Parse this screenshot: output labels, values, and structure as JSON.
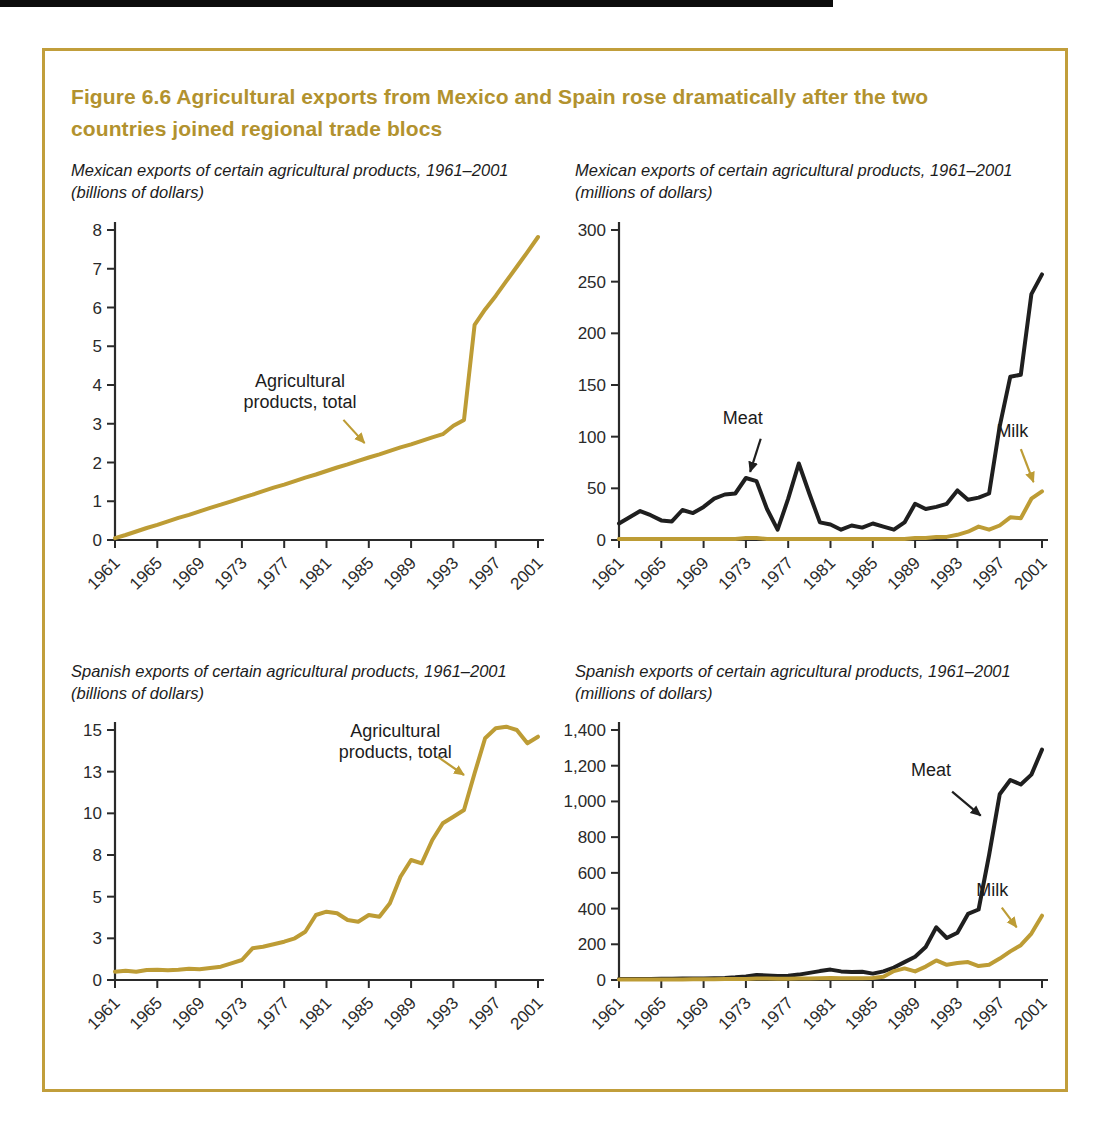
{
  "figure": {
    "title": "Figure 6.6  Agricultural exports from Mexico and Spain rose dramatically after the two countries joined regional trade blocs",
    "colors": {
      "gold": "#BD9C35",
      "black": "#1F1F1F",
      "border_gold": "#C19E3B",
      "title_gold": "#B2922E",
      "axis": "#2A2A2A",
      "label_text": "#2A2A2A"
    }
  },
  "chart_data": [
    {
      "id": "mexico-total",
      "type": "line",
      "subtitle_line1": "Mexican exports of certain agricultural products, 1961–2001",
      "subtitle_line2": "(billions of dollars)",
      "x_start": 1961,
      "x_end": 2001,
      "xticks": [
        1961,
        1965,
        1969,
        1973,
        1977,
        1981,
        1985,
        1989,
        1993,
        1997,
        2001
      ],
      "yticks": [
        {
          "v": 0,
          "label": "0"
        },
        {
          "v": 1,
          "label": "1"
        },
        {
          "v": 2,
          "label": "2"
        },
        {
          "v": 3,
          "label": "3"
        },
        {
          "v": 4,
          "label": "4"
        },
        {
          "v": 5,
          "label": "5"
        },
        {
          "v": 6,
          "label": "6"
        },
        {
          "v": 7,
          "label": "7"
        },
        {
          "v": 8,
          "label": "8"
        }
      ],
      "ylim": [
        0,
        8
      ],
      "series": [
        {
          "name": "Agricultural products, total",
          "color_key": "gold",
          "values": [
            0.05,
            0.13,
            0.22,
            0.31,
            0.39,
            0.48,
            0.57,
            0.65,
            0.74,
            0.83,
            0.91,
            1.0,
            1.09,
            1.17,
            1.26,
            1.35,
            1.43,
            1.52,
            1.61,
            1.69,
            1.78,
            1.87,
            1.95,
            2.04,
            2.13,
            2.21,
            2.3,
            2.39,
            2.47,
            2.56,
            2.65,
            2.73,
            2.95,
            3.1,
            5.55,
            5.95,
            6.3,
            6.68,
            7.05,
            7.43,
            7.82
          ]
        }
      ],
      "annotations": [
        {
          "lines": [
            "Agricultural",
            "products, total"
          ],
          "color_key": "gold",
          "text": {
            "x": 1978.5,
            "y": 3.95
          },
          "arrow": {
            "x1": 1982.6,
            "y1": 3.1,
            "x2": 1984.6,
            "y2": 2.5
          }
        }
      ]
    },
    {
      "id": "mexico-products",
      "type": "line",
      "subtitle_line1": "Mexican exports of certain agricultural products, 1961–2001",
      "subtitle_line2": "(millions of dollars)",
      "x_start": 1961,
      "x_end": 2001,
      "xticks": [
        1961,
        1965,
        1969,
        1973,
        1977,
        1981,
        1985,
        1989,
        1993,
        1997,
        2001
      ],
      "yticks": [
        {
          "v": 0,
          "label": "0"
        },
        {
          "v": 50,
          "label": "50"
        },
        {
          "v": 100,
          "label": "100"
        },
        {
          "v": 150,
          "label": "150"
        },
        {
          "v": 200,
          "label": "200"
        },
        {
          "v": 250,
          "label": "250"
        },
        {
          "v": 300,
          "label": "300"
        }
      ],
      "ylim": [
        0,
        300
      ],
      "series": [
        {
          "name": "Meat",
          "color_key": "black",
          "values": [
            16,
            22,
            28,
            24,
            19,
            18,
            29,
            26,
            32,
            40,
            44,
            45,
            60,
            57,
            30,
            10,
            40,
            74,
            45,
            17,
            15,
            10,
            14,
            12,
            16,
            13,
            10,
            17,
            35,
            30,
            32,
            35,
            48,
            39,
            41,
            45,
            110,
            158,
            160,
            238,
            257
          ]
        },
        {
          "name": "Milk",
          "color_key": "gold",
          "values": [
            1,
            1,
            1,
            1,
            1,
            1,
            1,
            1,
            1,
            1,
            1,
            1,
            2,
            2,
            1,
            1,
            1,
            1,
            1,
            1,
            1,
            1,
            1,
            1,
            1,
            1,
            1,
            1,
            2,
            2,
            3,
            3,
            5,
            8,
            13,
            10,
            14,
            22,
            21,
            40,
            47
          ]
        }
      ],
      "annotations": [
        {
          "lines": [
            "Meat"
          ],
          "color_key": "black",
          "text": {
            "x": 1972.7,
            "y": 112
          },
          "arrow": {
            "x1": 1974.4,
            "y1": 98,
            "x2": 1973.4,
            "y2": 66
          }
        },
        {
          "lines": [
            "Milk"
          ],
          "color_key": "gold",
          "text": {
            "x": 1998.2,
            "y": 100
          },
          "arrow": {
            "x1": 1999.0,
            "y1": 88,
            "x2": 2000.2,
            "y2": 56
          }
        }
      ]
    },
    {
      "id": "spain-total",
      "type": "line",
      "subtitle_line1": "Spanish exports of certain agricultural products, 1961–2001",
      "subtitle_line2": "(billions of dollars)",
      "x_start": 1961,
      "x_end": 2001,
      "xticks": [
        1961,
        1965,
        1969,
        1973,
        1977,
        1981,
        1985,
        1989,
        1993,
        1997,
        2001
      ],
      "yticks": [
        {
          "v": 0,
          "label": "0"
        },
        {
          "v": 2.5,
          "label": "3"
        },
        {
          "v": 5,
          "label": "5"
        },
        {
          "v": 7.5,
          "label": "8"
        },
        {
          "v": 10,
          "label": "10"
        },
        {
          "v": 12.5,
          "label": "13"
        },
        {
          "v": 15,
          "label": "15"
        }
      ],
      "ylim": [
        0,
        15
      ],
      "series": [
        {
          "name": "Agricultural products, total",
          "color_key": "gold",
          "values": [
            0.5,
            0.55,
            0.5,
            0.6,
            0.62,
            0.58,
            0.62,
            0.68,
            0.65,
            0.72,
            0.8,
            1.0,
            1.2,
            1.9,
            2.0,
            2.15,
            2.3,
            2.5,
            2.9,
            3.9,
            4.1,
            4.0,
            3.6,
            3.5,
            3.9,
            3.8,
            4.6,
            6.2,
            7.2,
            7.0,
            8.4,
            9.4,
            9.8,
            10.2,
            12.4,
            14.5,
            15.1,
            15.2,
            15.0,
            14.2,
            14.6
          ]
        }
      ],
      "annotations": [
        {
          "lines": [
            "Agricultural",
            "products, total"
          ],
          "color_key": "gold",
          "text": {
            "x": 1987.5,
            "y": 14.6
          },
          "arrow": {
            "x1": 1991.5,
            "y1": 13.4,
            "x2": 1994.0,
            "y2": 12.3
          }
        }
      ]
    },
    {
      "id": "spain-products",
      "type": "line",
      "subtitle_line1": "Spanish exports of certain agricultural products, 1961–2001",
      "subtitle_line2": "(millions of dollars)",
      "x_start": 1961,
      "x_end": 2001,
      "xticks": [
        1961,
        1965,
        1969,
        1973,
        1977,
        1981,
        1985,
        1989,
        1993,
        1997,
        2001
      ],
      "yticks": [
        {
          "v": 0,
          "label": "0"
        },
        {
          "v": 200,
          "label": "200"
        },
        {
          "v": 400,
          "label": "400"
        },
        {
          "v": 600,
          "label": "600"
        },
        {
          "v": 800,
          "label": "800"
        },
        {
          "v": 1000,
          "label": "1,000"
        },
        {
          "v": 1200,
          "label": "1,200"
        },
        {
          "v": 1400,
          "label": "1,400"
        }
      ],
      "ylim": [
        0,
        1400
      ],
      "series": [
        {
          "name": "Meat",
          "color_key": "black",
          "values": [
            5,
            5,
            6,
            6,
            7,
            7,
            8,
            8,
            9,
            10,
            12,
            15,
            20,
            28,
            25,
            22,
            24,
            30,
            40,
            50,
            58,
            48,
            45,
            46,
            36,
            48,
            70,
            100,
            130,
            185,
            295,
            235,
            265,
            370,
            395,
            700,
            1040,
            1120,
            1095,
            1150,
            1290
          ]
        },
        {
          "name": "Milk",
          "color_key": "gold",
          "values": [
            2,
            2,
            2,
            3,
            3,
            3,
            3,
            4,
            4,
            4,
            5,
            5,
            6,
            8,
            8,
            7,
            7,
            8,
            9,
            10,
            12,
            10,
            10,
            10,
            12,
            18,
            50,
            65,
            48,
            75,
            110,
            85,
            95,
            100,
            78,
            85,
            120,
            160,
            195,
            260,
            360
          ]
        }
      ],
      "annotations": [
        {
          "lines": [
            "Meat"
          ],
          "color_key": "black",
          "text": {
            "x": 1990.5,
            "y": 1140
          },
          "arrow": {
            "x1": 1992.5,
            "y1": 1055,
            "x2": 1995.2,
            "y2": 920
          }
        },
        {
          "lines": [
            "Milk"
          ],
          "color_key": "gold",
          "text": {
            "x": 1996.3,
            "y": 470
          },
          "arrow": {
            "x1": 1997.2,
            "y1": 405,
            "x2": 1998.6,
            "y2": 295
          }
        }
      ]
    }
  ]
}
